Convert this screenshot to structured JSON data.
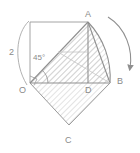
{
  "figure": {
    "kind": "geometry-diagram",
    "colors": {
      "stroke": "#8f8f8f",
      "stroke_light": "#b4b4b4",
      "hatch": "#bdbdbd",
      "text": "#8a8a8a",
      "background": "#ffffff"
    },
    "vertex_labels": [
      {
        "name": "A",
        "text": "A",
        "x": 85,
        "y": 10
      },
      {
        "name": "B",
        "text": "B",
        "x": 117,
        "y": 77
      },
      {
        "name": "O",
        "text": "O",
        "x": 19,
        "y": 86
      },
      {
        "name": "C",
        "text": "C",
        "x": 65,
        "y": 136
      },
      {
        "name": "D",
        "text": "D",
        "x": 85,
        "y": 86
      }
    ],
    "measure_labels": [
      {
        "name": "radius-length",
        "text": "2",
        "x": 9,
        "y": 48
      },
      {
        "name": "angle-measure",
        "text": "45°",
        "x": 33,
        "y": 54
      }
    ],
    "points": {
      "O": {
        "x": 30,
        "y": 83
      },
      "A": {
        "x": 88,
        "y": 22
      },
      "B": {
        "x": 110,
        "y": 83
      },
      "C": {
        "x": 69,
        "y": 125
      },
      "D": {
        "x": 88,
        "y": 83
      },
      "rect_top_left": {
        "x": 30,
        "y": 22
      }
    },
    "sector": {
      "center_x": 30,
      "center_y": 83,
      "radius": 80,
      "start_angle_deg": 46,
      "end_angle_deg": 0
    },
    "rotation_arrow": {
      "name": "rotation-arrow",
      "from_x": 108,
      "from_y": 17,
      "to_x": 131,
      "to_y": 71
    }
  }
}
